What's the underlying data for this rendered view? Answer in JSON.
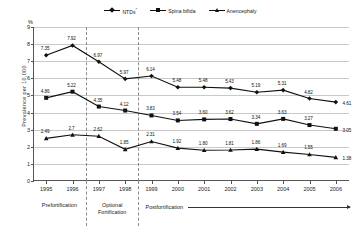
{
  "chart_data": {
    "type": "line",
    "title": "",
    "xlabel": "",
    "ylabel": "Prevalence  per  10,000",
    "unit_label": "%",
    "categories": [
      "1995",
      "1996",
      "1997",
      "1998",
      "1999",
      "2000",
      "2001",
      "2002",
      "2003",
      "2004",
      "2005",
      "2006"
    ],
    "ylim": [
      0,
      9
    ],
    "yticks": [
      0,
      1,
      2,
      3,
      4,
      5,
      6,
      7,
      8,
      9
    ],
    "grid": true,
    "legend_position": "top-center",
    "series": [
      {
        "name": "NTDs",
        "name_superscript": "*",
        "marker": "diamond",
        "color": "#111111",
        "values": [
          7.35,
          7.92,
          6.97,
          5.97,
          6.14,
          5.48,
          5.48,
          5.43,
          5.19,
          5.31,
          4.82,
          4.61
        ],
        "labels": [
          "7.35",
          "7.92",
          "6.97",
          "5.97",
          "6.14",
          "5.48",
          "5.48",
          "5.43",
          "5.19",
          "5.31",
          "4.82",
          "4.61"
        ]
      },
      {
        "name": "Spina bifida",
        "marker": "square",
        "color": "#111111",
        "values": [
          4.86,
          5.22,
          4.35,
          4.12,
          3.83,
          3.54,
          3.6,
          3.62,
          3.34,
          3.63,
          3.27,
          3.05
        ],
        "labels": [
          "4.86",
          "5.22",
          "4.35",
          "4.12",
          "3.83",
          "3.54",
          "3.60",
          "3.62",
          "3.34",
          "3.63",
          "3.27",
          "3.05"
        ]
      },
      {
        "name": "Anencephaly",
        "marker": "triangle",
        "color": "#111111",
        "values": [
          2.49,
          2.7,
          2.62,
          1.85,
          2.31,
          1.92,
          1.8,
          1.81,
          1.86,
          1.69,
          1.55,
          1.38
        ],
        "labels": [
          "2.49",
          "2.7",
          "2.62",
          "1.85",
          "2.31",
          "1.92",
          "1.80",
          "1.81",
          "1.86",
          "1.69",
          "1.55",
          "1.38"
        ]
      }
    ],
    "annotations": {
      "dividers_after_category": [
        "1996",
        "1998"
      ],
      "bands": [
        {
          "label": "Prefortification",
          "from": "1995",
          "to": "1996",
          "arrow": false
        },
        {
          "label": "Optional\nFortification",
          "from": "1997",
          "to": "1998",
          "arrow": false
        },
        {
          "label": "Postfortification",
          "from": "1999",
          "to": "2006",
          "arrow": true
        }
      ]
    }
  }
}
